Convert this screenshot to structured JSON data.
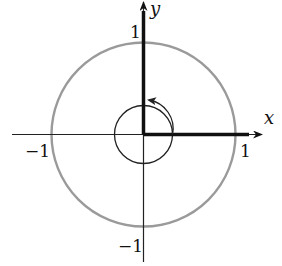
{
  "diagram": {
    "axes": {
      "x_label": "x",
      "y_label": "y"
    },
    "ticks": {
      "x_pos": "1",
      "x_neg": "−1",
      "y_pos": "1",
      "y_neg": "−1"
    },
    "elements": [
      {
        "name": "unit-circle",
        "type": "circle",
        "radius": 1,
        "color": "#9a9a9a"
      },
      {
        "name": "small-circle",
        "type": "circle",
        "radius": 0.31,
        "color": "#222222"
      },
      {
        "name": "thick-segment-x",
        "from": [
          0,
          0
        ],
        "to": [
          1.1,
          0
        ],
        "color": "#111111"
      },
      {
        "name": "thick-segment-y",
        "from": [
          0,
          0
        ],
        "to": [
          0,
          1.35
        ],
        "color": "#111111"
      },
      {
        "name": "rotation-arrow",
        "type": "arc",
        "from_angle_deg": 0,
        "to_angle_deg": 90,
        "direction": "counterclockwise"
      }
    ]
  }
}
